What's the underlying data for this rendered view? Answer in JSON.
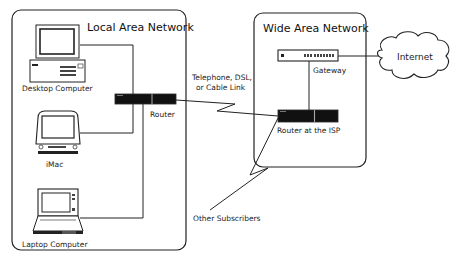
{
  "diagram": {
    "lan": {
      "title": "Local Area Network"
    },
    "wan": {
      "title": "Wide Area Network"
    },
    "nodes": {
      "desktop": {
        "label": "Desktop Computer",
        "icon": "desktop-computer-icon"
      },
      "imac": {
        "label": "iMac",
        "icon": "imac-icon"
      },
      "laptop": {
        "label": "Laptop Computer",
        "icon": "laptop-icon"
      },
      "router": {
        "label": "Router",
        "icon": "router-icon"
      },
      "gateway": {
        "label": "Gateway",
        "icon": "gateway-icon"
      },
      "isp_router": {
        "label": "Router at the ISP",
        "icon": "router-icon"
      },
      "internet": {
        "label": "Internet",
        "icon": "cloud-icon"
      },
      "others": {
        "label": "Other Subscribers"
      }
    },
    "links": {
      "lan_wan": {
        "label_line1": "Telephone, DSL,",
        "label_line2": "or Cable Link"
      }
    }
  }
}
